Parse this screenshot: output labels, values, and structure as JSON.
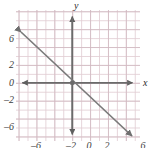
{
  "figure": {
    "kind": "cartesian-coordinate-plane",
    "background_color": "#ffffff",
    "grid_color": "#e2ced4",
    "grid_major_color": "#d0b8c0",
    "axis_color": "#6b6b6b",
    "line_color": "#7a7a7a",
    "label_color": "#3c3c3c"
  },
  "axes": {
    "x_label": "x",
    "y_label": "y",
    "origin_label": "0"
  },
  "chart_data": {
    "type": "line",
    "title": "",
    "xlabel": "x",
    "ylabel": "y",
    "grid": true,
    "legend": "none",
    "xlim": [
      -7,
      7
    ],
    "ylim": [
      -8,
      8
    ],
    "x_ticks": [
      -6,
      -2,
      0,
      2,
      6
    ],
    "y_ticks": [
      6,
      2,
      0,
      -2,
      -6
    ],
    "x_tick_labels": [
      "–6",
      "–2",
      "0",
      "2",
      "6"
    ],
    "y_tick_labels": [
      "6",
      "2",
      "0",
      "–2",
      "–6"
    ],
    "series": [
      {
        "name": "y = -x",
        "slope": -1,
        "intercept": 0,
        "arrows": "both",
        "x": [
          -6.3,
          7.3
        ],
        "values": [
          6.3,
          -7.3
        ]
      }
    ],
    "annotations": [
      {
        "name": "origin-point",
        "x": 0,
        "y": 0
      }
    ]
  },
  "ticks": {
    "y": [
      {
        "label": "6",
        "top": 34
      },
      {
        "label": "2",
        "top": 60
      },
      {
        "label": "0",
        "top": 78
      },
      {
        "label": "–2",
        "top": 95
      },
      {
        "label": "–6",
        "top": 122
      }
    ],
    "x": [
      {
        "label": "–6",
        "left": 29
      },
      {
        "label": "–2",
        "left": 64
      },
      {
        "label": "0",
        "left": 82
      },
      {
        "label": "2",
        "left": 100
      },
      {
        "label": "6",
        "left": 136
      }
    ]
  }
}
